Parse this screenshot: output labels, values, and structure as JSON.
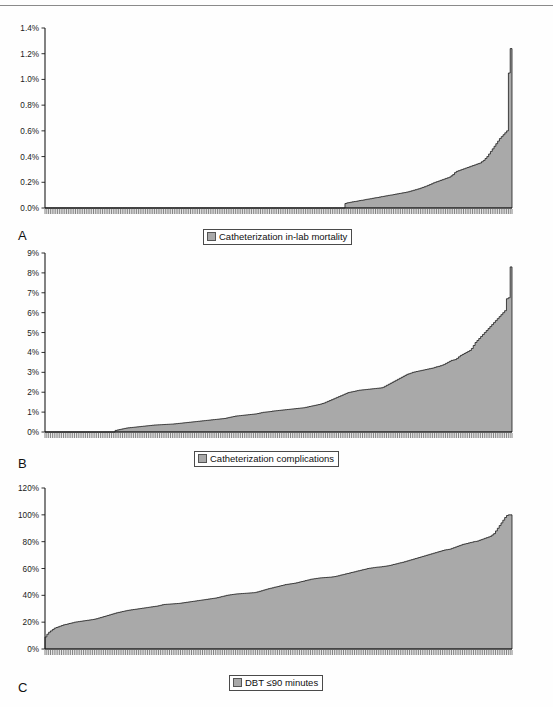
{
  "figure": {
    "background": "#fefefe",
    "series_fill": "#a9a9a9",
    "series_stroke": "#1a1a1a",
    "axis_color": "#1a1a1a"
  },
  "panels": [
    {
      "letter": "A",
      "legend_label": "Catheterization in-lab mortality",
      "legend_swatch_color": "#a9a9a9",
      "chart_data": {
        "type": "area",
        "title": "",
        "xlabel": "",
        "ylabel": "",
        "ylim": [
          0,
          1.4
        ],
        "yticks": [
          0,
          0.2,
          0.4,
          0.6,
          0.8,
          1.0,
          1.2,
          1.4
        ],
        "ytick_labels": [
          "0.0%",
          "0.2%",
          "0.4%",
          "0.6%",
          "0.8%",
          "1.0%",
          "1.2%",
          "1.4%"
        ],
        "grid": false,
        "legend_position": "bottom",
        "n_points": 252,
        "x_tick_marks": true,
        "x_tick_labels": [],
        "values": [
          0,
          0,
          0,
          0,
          0,
          0,
          0,
          0,
          0,
          0,
          0,
          0,
          0,
          0,
          0,
          0,
          0,
          0,
          0,
          0,
          0,
          0,
          0,
          0,
          0,
          0,
          0,
          0,
          0,
          0,
          0,
          0,
          0,
          0,
          0,
          0,
          0,
          0,
          0,
          0,
          0,
          0,
          0,
          0,
          0,
          0,
          0,
          0,
          0,
          0,
          0,
          0,
          0,
          0,
          0,
          0,
          0,
          0,
          0,
          0,
          0,
          0,
          0,
          0,
          0,
          0,
          0,
          0,
          0,
          0,
          0,
          0,
          0,
          0,
          0,
          0,
          0,
          0,
          0,
          0,
          0,
          0,
          0,
          0,
          0,
          0,
          0,
          0,
          0,
          0,
          0,
          0,
          0,
          0,
          0,
          0,
          0,
          0,
          0,
          0,
          0,
          0,
          0,
          0,
          0,
          0,
          0,
          0,
          0,
          0,
          0,
          0,
          0,
          0,
          0,
          0,
          0,
          0,
          0,
          0,
          0,
          0,
          0,
          0,
          0,
          0,
          0,
          0,
          0,
          0,
          0,
          0,
          0,
          0,
          0,
          0,
          0,
          0,
          0,
          0,
          0,
          0,
          0,
          0,
          0,
          0,
          0,
          0,
          0,
          0,
          0,
          0,
          0,
          0,
          0,
          0,
          0,
          0,
          0,
          0,
          0,
          0,
          0,
          0,
          0,
          0,
          0,
          0.035,
          0.04,
          0.042,
          0.045,
          0.048,
          0.05,
          0.052,
          0.055,
          0.058,
          0.06,
          0.062,
          0.065,
          0.068,
          0.07,
          0.072,
          0.075,
          0.078,
          0.08,
          0.082,
          0.085,
          0.088,
          0.09,
          0.093,
          0.095,
          0.098,
          0.1,
          0.102,
          0.105,
          0.108,
          0.11,
          0.113,
          0.115,
          0.118,
          0.12,
          0.123,
          0.126,
          0.13,
          0.134,
          0.138,
          0.142,
          0.146,
          0.15,
          0.155,
          0.16,
          0.165,
          0.17,
          0.176,
          0.182,
          0.188,
          0.195,
          0.2,
          0.205,
          0.21,
          0.215,
          0.22,
          0.225,
          0.23,
          0.235,
          0.24,
          0.25,
          0.26,
          0.275,
          0.285,
          0.29,
          0.295,
          0.3,
          0.305,
          0.31,
          0.315,
          0.32,
          0.325,
          0.33,
          0.335,
          0.34,
          0.345,
          0.35,
          0.36,
          0.37,
          0.385,
          0.4,
          0.42,
          0.44,
          0.46,
          0.48,
          0.5,
          0.52,
          0.54,
          0.555,
          0.57,
          0.585,
          0.6,
          1.05,
          1.24
        ]
      }
    },
    {
      "letter": "B",
      "legend_label": "Catheterization complications",
      "legend_swatch_color": "#a9a9a9",
      "chart_data": {
        "type": "area",
        "title": "",
        "xlabel": "",
        "ylabel": "",
        "ylim": [
          0,
          9
        ],
        "yticks": [
          0,
          1,
          2,
          3,
          4,
          5,
          6,
          7,
          8,
          9
        ],
        "ytick_labels": [
          "0%",
          "1%",
          "2%",
          "3%",
          "4%",
          "5%",
          "6%",
          "7%",
          "8%",
          "9%"
        ],
        "grid": false,
        "legend_position": "bottom",
        "n_points": 252,
        "x_tick_marks": true,
        "x_tick_labels": [],
        "values": [
          0,
          0,
          0,
          0,
          0,
          0,
          0,
          0,
          0,
          0,
          0,
          0,
          0,
          0,
          0,
          0,
          0,
          0,
          0,
          0,
          0,
          0,
          0,
          0,
          0,
          0,
          0,
          0,
          0,
          0,
          0,
          0,
          0,
          0,
          0,
          0,
          0,
          0,
          0.08,
          0.1,
          0.12,
          0.14,
          0.16,
          0.18,
          0.2,
          0.21,
          0.22,
          0.23,
          0.24,
          0.25,
          0.26,
          0.27,
          0.28,
          0.29,
          0.3,
          0.31,
          0.32,
          0.33,
          0.34,
          0.35,
          0.355,
          0.36,
          0.365,
          0.37,
          0.375,
          0.38,
          0.385,
          0.39,
          0.395,
          0.4,
          0.41,
          0.42,
          0.43,
          0.44,
          0.45,
          0.46,
          0.47,
          0.48,
          0.49,
          0.5,
          0.51,
          0.52,
          0.53,
          0.54,
          0.55,
          0.56,
          0.57,
          0.58,
          0.59,
          0.6,
          0.61,
          0.62,
          0.63,
          0.64,
          0.65,
          0.66,
          0.67,
          0.68,
          0.7,
          0.72,
          0.74,
          0.76,
          0.78,
          0.8,
          0.81,
          0.82,
          0.83,
          0.84,
          0.85,
          0.86,
          0.87,
          0.88,
          0.89,
          0.9,
          0.91,
          0.93,
          0.95,
          0.97,
          0.99,
          1.0,
          1.01,
          1.02,
          1.03,
          1.05,
          1.06,
          1.07,
          1.08,
          1.09,
          1.1,
          1.11,
          1.12,
          1.13,
          1.14,
          1.15,
          1.16,
          1.17,
          1.18,
          1.19,
          1.2,
          1.21,
          1.22,
          1.24,
          1.26,
          1.28,
          1.3,
          1.32,
          1.34,
          1.36,
          1.38,
          1.4,
          1.43,
          1.46,
          1.5,
          1.54,
          1.58,
          1.62,
          1.66,
          1.7,
          1.74,
          1.78,
          1.82,
          1.86,
          1.9,
          1.94,
          1.98,
          2.0,
          2.02,
          2.04,
          2.06,
          2.08,
          2.1,
          2.11,
          2.12,
          2.13,
          2.14,
          2.15,
          2.16,
          2.17,
          2.18,
          2.19,
          2.2,
          2.21,
          2.22,
          2.25,
          2.3,
          2.35,
          2.4,
          2.45,
          2.5,
          2.55,
          2.6,
          2.65,
          2.7,
          2.75,
          2.8,
          2.85,
          2.9,
          2.93,
          2.96,
          3.0,
          3.02,
          3.04,
          3.06,
          3.08,
          3.1,
          3.12,
          3.14,
          3.16,
          3.18,
          3.2,
          3.22,
          3.25,
          3.28,
          3.3,
          3.33,
          3.36,
          3.4,
          3.45,
          3.5,
          3.55,
          3.6,
          3.62,
          3.64,
          3.7,
          3.78,
          3.85,
          3.9,
          3.95,
          4.0,
          4.05,
          4.1,
          4.2,
          4.35,
          4.5,
          4.6,
          4.7,
          4.8,
          4.9,
          5.0,
          5.1,
          5.2,
          5.3,
          5.4,
          5.5,
          5.6,
          5.7,
          5.8,
          5.9,
          6.0,
          6.1,
          6.7,
          6.75,
          8.3
        ]
      }
    },
    {
      "letter": "C",
      "legend_label": "DBT ≤90 minutes",
      "legend_swatch_color": "#a9a9a9",
      "chart_data": {
        "type": "area",
        "title": "",
        "xlabel": "",
        "ylabel": "",
        "ylim": [
          0,
          120
        ],
        "yticks": [
          0,
          20,
          40,
          60,
          80,
          100,
          120
        ],
        "ytick_labels": [
          "0%",
          "20%",
          "40%",
          "60%",
          "80%",
          "100%",
          "120%"
        ],
        "grid": false,
        "legend_position": "bottom",
        "n_points": 252,
        "x_tick_marks": true,
        "x_tick_labels": [],
        "values": [
          9,
          11,
          12.5,
          13.5,
          14.5,
          15.5,
          16,
          16.5,
          17,
          17.5,
          18,
          18.3,
          18.6,
          19,
          19.3,
          19.6,
          20,
          20.2,
          20.4,
          20.6,
          20.8,
          21,
          21.2,
          21.4,
          21.6,
          21.8,
          22,
          22.3,
          22.6,
          23,
          23.4,
          23.8,
          24.2,
          24.6,
          25,
          25.4,
          25.8,
          26.2,
          26.6,
          27,
          27.3,
          27.6,
          27.9,
          28.2,
          28.5,
          28.8,
          29,
          29.2,
          29.4,
          29.6,
          29.8,
          30,
          30.2,
          30.4,
          30.6,
          30.8,
          31,
          31.2,
          31.4,
          31.6,
          31.8,
          32,
          32.3,
          32.6,
          33,
          33.2,
          33.3,
          33.4,
          33.5,
          33.6,
          33.7,
          33.8,
          33.9,
          34,
          34.2,
          34.4,
          34.6,
          34.8,
          35,
          35.2,
          35.4,
          35.6,
          35.8,
          36,
          36.2,
          36.4,
          36.6,
          36.8,
          37,
          37.2,
          37.4,
          37.6,
          37.8,
          38,
          38.3,
          38.6,
          39,
          39.3,
          39.6,
          40,
          40.2,
          40.4,
          40.6,
          40.8,
          41,
          41.1,
          41.2,
          41.3,
          41.4,
          41.5,
          41.6,
          41.7,
          41.8,
          41.9,
          42,
          42.3,
          42.6,
          43,
          43.4,
          43.8,
          44.2,
          44.6,
          45,
          45.3,
          45.6,
          46,
          46.3,
          46.6,
          47,
          47.3,
          47.6,
          48,
          48.2,
          48.4,
          48.6,
          48.8,
          49,
          49.3,
          49.6,
          50,
          50.3,
          50.6,
          51,
          51.3,
          51.6,
          52,
          52.2,
          52.4,
          52.6,
          52.8,
          53,
          53.1,
          53.2,
          53.3,
          53.4,
          53.5,
          53.6,
          53.8,
          54,
          54.3,
          54.6,
          55,
          55.3,
          55.6,
          56,
          56.3,
          56.6,
          57,
          57.3,
          57.6,
          58,
          58.3,
          58.6,
          59,
          59.3,
          59.6,
          60,
          60.2,
          60.4,
          60.6,
          60.8,
          61,
          61.1,
          61.2,
          61.4,
          61.6,
          61.8,
          62,
          62.3,
          62.6,
          63,
          63.3,
          63.6,
          64,
          64.3,
          64.6,
          65,
          65.4,
          65.8,
          66.2,
          66.6,
          67,
          67.4,
          67.8,
          68.2,
          68.6,
          69,
          69.4,
          69.8,
          70.2,
          70.6,
          71,
          71.4,
          71.8,
          72.2,
          72.6,
          73,
          73.4,
          73.8,
          74,
          74.2,
          74.5,
          75,
          75.5,
          76,
          76.5,
          77,
          77.5,
          78,
          78.3,
          78.6,
          79,
          79.3,
          79.6,
          80,
          80.2,
          80.5,
          81,
          81.5,
          82,
          82.5,
          83,
          83.5,
          84,
          85,
          86,
          88,
          90,
          92,
          94,
          96,
          98,
          99.5,
          100,
          100
        ]
      }
    }
  ]
}
